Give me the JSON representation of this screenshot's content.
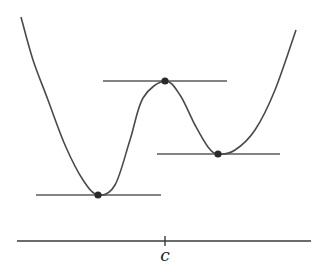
{
  "diagram": {
    "axis": {
      "label": "c",
      "x1": 17,
      "x2": 311,
      "y": 241,
      "tick_x": 165
    },
    "curve_points": [
      [
        21,
        17
      ],
      [
        33,
        60
      ],
      [
        48,
        100
      ],
      [
        65,
        145
      ],
      [
        83,
        180
      ],
      [
        98,
        195
      ],
      [
        115,
        185
      ],
      [
        130,
        140
      ],
      [
        143,
        98
      ],
      [
        165,
        81
      ],
      [
        180,
        95
      ],
      [
        195,
        125
      ],
      [
        208,
        147
      ],
      [
        218,
        154
      ],
      [
        235,
        150
      ],
      [
        255,
        130
      ],
      [
        275,
        90
      ],
      [
        296,
        30
      ]
    ],
    "critical_points": [
      {
        "name": "local-min-left",
        "x": 98,
        "y": 195,
        "tangent": [
          36,
          161
        ]
      },
      {
        "name": "local-max",
        "x": 165,
        "y": 81,
        "tangent": [
          103,
          227
        ]
      },
      {
        "name": "local-min-right",
        "x": 218,
        "y": 154,
        "tangent": [
          157,
          280
        ]
      }
    ],
    "colors": {
      "curve": "#4a4a4a",
      "tangent": "#5a5a5a",
      "point": "#2a2a2a",
      "background": "#ffffff"
    }
  }
}
